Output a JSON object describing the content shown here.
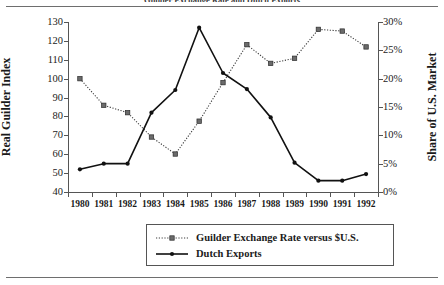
{
  "figure": {
    "title": "Guilder Exchange Rate and Dutch Exports"
  },
  "axes": {
    "left_title": "Real Guilder Index",
    "right_title": "Share of U.S. Market",
    "left_ticks": [
      "40",
      "50",
      "60",
      "70",
      "80",
      "90",
      "100",
      "110",
      "120",
      "130"
    ],
    "right_ticks": [
      "0%",
      "5%",
      "10%",
      "15%",
      "20%",
      "25%",
      "30%"
    ],
    "x_ticks": [
      "1980",
      "1981",
      "1982",
      "1983",
      "1984",
      "1985",
      "1986",
      "1987",
      "1988",
      "1989",
      "1990",
      "1991",
      "1992"
    ]
  },
  "legend": {
    "items": [
      {
        "label": "Guilder Exchange Rate versus $U.S.",
        "style": "dotted",
        "marker": "square",
        "color": "#3d3d3d"
      },
      {
        "label": "Dutch Exports",
        "style": "solid",
        "marker": "circle",
        "color": "#111111"
      }
    ]
  },
  "chart_data": {
    "type": "line",
    "title": "Guilder Exchange Rate and Dutch Exports",
    "xlabel": "",
    "x": [
      1980,
      1981,
      1982,
      1983,
      1984,
      1985,
      1986,
      1987,
      1988,
      1989,
      1990,
      1991,
      1992
    ],
    "categories": [
      "1980",
      "1981",
      "1982",
      "1983",
      "1984",
      "1985",
      "1986",
      "1987",
      "1988",
      "1989",
      "1990",
      "1991",
      "1992"
    ],
    "grid": false,
    "legend_position": "bottom",
    "series": [
      {
        "name": "Guilder Exchange Rate versus $U.S.",
        "axis": "right",
        "ylabel": "Share of U.S. Market",
        "ylim": [
          0,
          30
        ],
        "unit": "%",
        "linestyle": "dotted",
        "marker": "square",
        "color": "#3d3d3d",
        "values": [
          20.0,
          15.3,
          14.0,
          9.7,
          6.7,
          12.5,
          19.3,
          26.0,
          22.7,
          23.6,
          28.7,
          28.4,
          25.6
        ]
      },
      {
        "name": "Dutch Exports",
        "axis": "left",
        "ylabel": "Real Guilder Index",
        "ylim": [
          40,
          130
        ],
        "unit": "",
        "linestyle": "solid",
        "marker": "circle",
        "color": "#111111",
        "values": [
          52,
          55,
          55,
          82,
          94,
          127,
          103,
          94.5,
          79.5,
          55.5,
          46,
          46,
          49.5
        ]
      }
    ]
  }
}
